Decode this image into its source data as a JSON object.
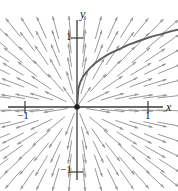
{
  "figure": {
    "kind": "direction-field-plot",
    "background_color": "#ffffff",
    "axis_color": "#3a3a3a",
    "field_color": "#9a9a9a",
    "curve_color": "#5c5c5c",
    "origin_dot_color": "#222222"
  },
  "axes": {
    "x_label": "x",
    "y_label": "y",
    "x_ticks": [
      {
        "label": "−1",
        "value": -1
      },
      {
        "label": "1",
        "value": 1
      }
    ],
    "y_ticks": [
      {
        "label": "1",
        "value": 1
      },
      {
        "label": "−1",
        "value": -1
      }
    ]
  },
  "chart_data": {
    "type": "scatter",
    "title": "",
    "subtitle": "",
    "xlabel": "x",
    "ylabel": "y",
    "xlim": [
      -1.45,
      1.45
    ],
    "ylim": [
      -1.35,
      1.35
    ],
    "grid": false,
    "legend": null,
    "x_tick_values": [
      -1,
      1
    ],
    "x_tick_labels": [
      "−1",
      "1"
    ],
    "y_tick_values": [
      -1,
      1
    ],
    "y_tick_labels": [
      "1",
      "−1"
    ],
    "field": {
      "description": "radial direction field; each segment points away from the origin along the ray through its base point",
      "slope_rule": "dy/dx = y/x",
      "grid_x": [
        -1.3,
        -1.1,
        -0.9,
        -0.7,
        -0.5,
        -0.3,
        -0.1,
        0.1,
        0.3,
        0.5,
        0.7,
        0.9,
        1.1,
        1.3
      ],
      "grid_y": [
        1.15,
        0.95,
        0.75,
        0.55,
        0.35,
        0.15,
        -0.05,
        -0.25,
        -0.45,
        -0.65,
        -0.85,
        -1.05
      ],
      "segment_length": 0.17,
      "arrowheads": true
    },
    "series": [
      {
        "name": "solution curve",
        "type": "line",
        "equation": "y = x^(1/3)",
        "x": [
          0.0,
          0.02,
          0.05,
          0.08,
          0.12,
          0.18,
          0.25,
          0.34,
          0.45,
          0.58,
          0.72,
          0.88,
          1.05,
          1.2,
          1.33,
          1.42
        ],
        "y": [
          0.0,
          0.27,
          0.37,
          0.43,
          0.49,
          0.56,
          0.63,
          0.7,
          0.77,
          0.83,
          0.9,
          0.96,
          1.02,
          1.06,
          1.1,
          1.12
        ]
      }
    ],
    "annotations": [
      {
        "label": "origin",
        "x": 0,
        "y": 0,
        "marker": "dot"
      }
    ]
  }
}
